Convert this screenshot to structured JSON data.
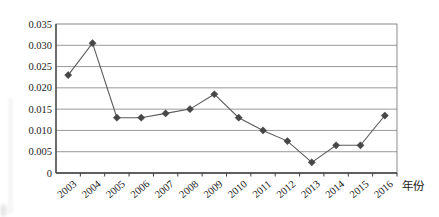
{
  "chart_data": {
    "type": "line",
    "title": "",
    "categories": [
      "2003",
      "2004",
      "2005",
      "2006",
      "2007",
      "2008",
      "2009",
      "2010",
      "2011",
      "2012",
      "2013",
      "2014",
      "2015",
      "2016"
    ],
    "series": [
      {
        "name": "series-1",
        "values": [
          0.023,
          0.0305,
          0.013,
          0.013,
          0.014,
          0.015,
          0.0185,
          0.013,
          0.01,
          0.0075,
          0.0025,
          0.0065,
          0.0065,
          0.0135
        ]
      }
    ],
    "xlabel": "年份",
    "ylabel": "",
    "ylim": [
      0,
      0.035
    ],
    "ytick_step": 0.005,
    "ytick_labels": [
      "0",
      "0.005",
      "0.010",
      "0.015",
      "0.020",
      "0.025",
      "0.030",
      "0.035"
    ],
    "grid": true,
    "legend": false,
    "marker": "diamond",
    "colors": {
      "line": "#5a5a5a",
      "marker": "#474747",
      "gridline": "#7f7f7f",
      "axis": "#3d3d3d",
      "text": "#1a1a1a",
      "axis_title_text": "#2e2e2e",
      "background": "#ffffff"
    }
  }
}
